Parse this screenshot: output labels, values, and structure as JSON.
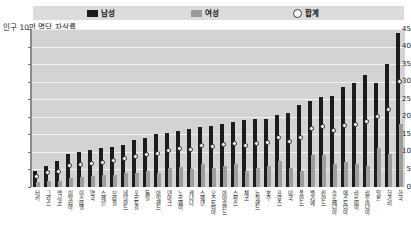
{
  "legend": {
    "items": [
      {
        "label": "남성",
        "marker": "square-black",
        "color": "#1c1c1c",
        "name": "legend-male"
      },
      {
        "label": "여성",
        "marker": "square-gray",
        "color": "#9d9d9d",
        "name": "legend-female"
      },
      {
        "label": "합계",
        "marker": "circle-open",
        "color": "#ffffff",
        "name": "legend-total"
      }
    ]
  },
  "axis_title": "인구 10만 명당 자살률",
  "chart_data": {
    "type": "bar",
    "title": "",
    "subtitle": "",
    "xlabel": "",
    "ylabel": "인구 10만 명당 자살률",
    "ylim": [
      0,
      45
    ],
    "yticks": [
      0,
      5,
      10,
      15,
      20,
      25,
      30,
      35,
      40,
      45
    ],
    "grid": true,
    "legend_position": "top",
    "categories": [
      "터키",
      "그리스",
      "멕시코",
      "이탈리아",
      "이스라엘",
      "영국",
      "스페인",
      "브라질",
      "네덜란드",
      "포르투갈",
      "독일",
      "아일랜드",
      "덴마크",
      "노르웨이",
      "캐나다",
      "스웨덴",
      "오스트리아",
      "아이슬란드",
      "스위스",
      "체코",
      "뉴질랜드",
      "호주",
      "프랑스",
      "미국",
      "폴란드",
      "벨기에",
      "핀란드",
      "슬로베니아",
      "에스토니아",
      "라트비아",
      "리투아니아",
      "일본",
      "헝가리",
      "한국"
    ],
    "series": [
      {
        "name": "남성",
        "color": "#1c1c1c",
        "values": [
          4.5,
          6.0,
          7.5,
          9.5,
          10.0,
          10.5,
          11.0,
          11.5,
          12.0,
          13.5,
          14.0,
          15.0,
          15.5,
          16.0,
          16.5,
          17.0,
          17.5,
          18.0,
          18.5,
          19.0,
          19.5,
          19.5,
          20.5,
          21.0,
          23.5,
          24.5,
          25.5,
          26.0,
          28.5,
          29.5,
          32.0,
          29.5,
          35.0,
          44.0
        ]
      },
      {
        "name": "여성",
        "color": "#9d9d9d",
        "values": [
          1.5,
          1.8,
          1.8,
          2.5,
          2.8,
          3.0,
          3.3,
          3.5,
          4.0,
          4.0,
          4.5,
          4.0,
          5.5,
          5.8,
          5.2,
          6.5,
          5.5,
          6.0,
          6.5,
          4.5,
          5.5,
          6.0,
          7.5,
          5.5,
          4.5,
          9.0,
          9.0,
          6.5,
          7.0,
          6.5,
          6.0,
          11.0,
          9.5,
          18.0
        ]
      }
    ],
    "total_markers": {
      "name": "합계",
      "marker": "circle-open",
      "values": [
        3.0,
        4.0,
        4.5,
        6.0,
        6.5,
        6.8,
        7.0,
        7.5,
        8.0,
        8.8,
        9.2,
        9.5,
        10.5,
        11.0,
        10.8,
        11.8,
        11.5,
        12.0,
        12.5,
        11.8,
        12.5,
        12.8,
        14.0,
        13.0,
        14.0,
        16.8,
        17.2,
        16.2,
        17.5,
        17.8,
        18.8,
        20.0,
        22.0,
        30.0
      ]
    }
  }
}
